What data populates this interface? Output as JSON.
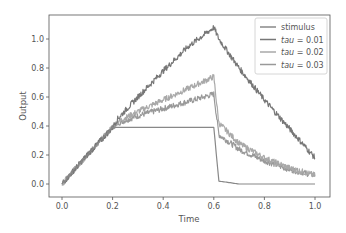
{
  "chart_data": {
    "type": "line",
    "title": "",
    "xlabel": "Time",
    "ylabel": "Output",
    "xlim": [
      -0.05,
      1.05
    ],
    "ylim": [
      -0.09,
      1.16
    ],
    "xticks": [
      "0.0",
      "0.2",
      "0.4",
      "0.6",
      "0.8",
      "1.0"
    ],
    "yticks": [
      "0.0",
      "0.2",
      "0.4",
      "0.6",
      "0.8",
      "1.0"
    ],
    "grid": false,
    "legend_position": "upper right",
    "x": [
      0.0,
      0.1,
      0.2,
      0.22,
      0.3,
      0.4,
      0.5,
      0.6,
      0.62,
      0.7,
      0.8,
      0.9,
      1.0
    ],
    "series": [
      {
        "name": "stimulus",
        "label": "stimulus",
        "color": "#888888",
        "values": [
          0.0,
          0.2,
          0.39,
          0.39,
          0.39,
          0.39,
          0.39,
          0.39,
          0.02,
          0.0,
          0.0,
          0.0,
          0.0
        ]
      },
      {
        "name": "tau = 0.01",
        "label": "tau = 0.01",
        "color": "#777777",
        "values": [
          0.0,
          0.2,
          0.39,
          0.45,
          0.6,
          0.78,
          0.95,
          1.08,
          1.0,
          0.8,
          0.58,
          0.38,
          0.18
        ]
      },
      {
        "name": "tau = 0.02",
        "label": "tau = 0.02",
        "color": "#a9a9a9",
        "values": [
          0.0,
          0.2,
          0.39,
          0.43,
          0.5,
          0.58,
          0.66,
          0.74,
          0.42,
          0.28,
          0.18,
          0.11,
          0.06
        ]
      },
      {
        "name": "tau = 0.03",
        "label": "tau = 0.03",
        "color": "#999999",
        "values": [
          0.0,
          0.2,
          0.39,
          0.42,
          0.47,
          0.52,
          0.57,
          0.62,
          0.34,
          0.24,
          0.16,
          0.1,
          0.06
        ]
      }
    ]
  },
  "legend": {
    "items": [
      {
        "prefix": "stimulus",
        "italic": "",
        "suffix": ""
      },
      {
        "prefix": "",
        "italic": "tau",
        "suffix": " = 0.01"
      },
      {
        "prefix": "",
        "italic": "tau",
        "suffix": " = 0.02"
      },
      {
        "prefix": "",
        "italic": "tau",
        "suffix": " = 0.03"
      }
    ]
  }
}
